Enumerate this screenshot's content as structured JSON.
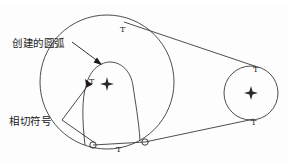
{
  "diagram": {
    "labels": [
      {
        "id": "created-arc",
        "text": "创建的圆弧",
        "x": 12,
        "y": 38
      },
      {
        "id": "tangent-symbol",
        "text": "相切符号",
        "x": 9,
        "y": 116
      }
    ],
    "tangent_marks": [
      {
        "id": "t-big-circle-top",
        "text": "T",
        "x": 120,
        "y": 26
      },
      {
        "id": "t-inner-arc-left",
        "text": "T",
        "x": 89,
        "y": 78
      },
      {
        "id": "t-bottom-middle",
        "text": "T",
        "x": 116,
        "y": 146
      },
      {
        "id": "t-small-circle-top",
        "text": "T",
        "x": 253,
        "y": 66
      },
      {
        "id": "t-small-circle-bottom",
        "text": "T",
        "x": 251,
        "y": 119
      }
    ],
    "shapes": {
      "big_circle": {
        "cx": 107,
        "cy": 82,
        "r": 67
      },
      "small_circle": {
        "cx": 251,
        "cy": 93,
        "r": 27
      },
      "inner_arc_center_mark": {
        "cx": 107,
        "cy": 84
      },
      "small_circle_center_mark": {
        "cx": 251,
        "cy": 93
      },
      "endpoint_left": {
        "cx": 93,
        "cy": 145,
        "r": 3.2
      },
      "endpoint_right": {
        "cx": 145,
        "cy": 142,
        "r": 3.2
      }
    },
    "colors": {
      "stroke": "#3a3a3a",
      "text": "#1a1a1a",
      "background": "#fdfdfd"
    }
  }
}
